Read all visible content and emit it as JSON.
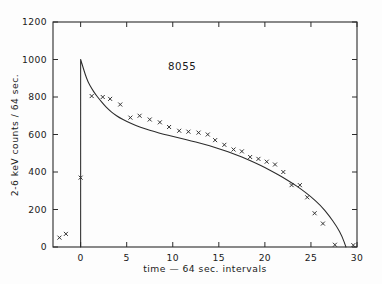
{
  "chart_data": {
    "type": "scatter",
    "title": "",
    "annotation": "8055",
    "xlabel": "time — 64 sec. intervals",
    "ylabel": "2-6 keV counts / 64 sec.",
    "xlim": [
      -3,
      30
    ],
    "ylim": [
      0,
      1200
    ],
    "xticks": [
      0,
      5,
      10,
      15,
      20,
      25,
      30
    ],
    "xtick_labels": [
      "0",
      "5",
      "10",
      "15",
      "20",
      "25",
      "30"
    ],
    "yticks": [
      0,
      200,
      400,
      600,
      800,
      1000,
      1200
    ],
    "ytick_labels": [
      "0",
      "200",
      "400",
      "600",
      "800",
      "1000",
      "1200"
    ],
    "grid": false,
    "legend": null,
    "marker": "x",
    "series": [
      {
        "name": "2-6 keV counts",
        "marker": "x",
        "color": "#2b2b2b",
        "x": [
          -2.3,
          -1.6,
          0.0,
          1.2,
          2.4,
          3.2,
          4.3,
          5.4,
          6.4,
          7.5,
          8.6,
          9.6,
          10.7,
          11.7,
          12.8,
          13.8,
          14.6,
          15.6,
          16.6,
          17.5,
          18.4,
          19.3,
          20.2,
          21.1,
          22.0,
          22.9,
          23.8,
          24.6,
          25.4,
          26.3,
          27.6,
          29.6
        ],
        "y": [
          50,
          70,
          370,
          805,
          800,
          790,
          760,
          690,
          700,
          680,
          665,
          640,
          620,
          615,
          610,
          600,
          570,
          545,
          520,
          510,
          480,
          470,
          455,
          440,
          400,
          330,
          330,
          265,
          180,
          125,
          12,
          10
        ]
      }
    ],
    "model": {
      "name": "fitted decay curve",
      "color": "#2b2b2b",
      "x": [
        0.0,
        0.25,
        0.5,
        0.8,
        1.2,
        1.6,
        2.0,
        2.5,
        3.0,
        3.6,
        4.2,
        5.0,
        6.0,
        7.0,
        8.0,
        9.0,
        10.0,
        11.0,
        12.0,
        13.0,
        14.0,
        15.0,
        16.0,
        17.0,
        18.0,
        19.0,
        20.0,
        21.0,
        22.0,
        23.0,
        24.0,
        25.0,
        26.0,
        27.0,
        27.8,
        28.4,
        28.8
      ],
      "y": [
        1000,
        960,
        920,
        880,
        845,
        815,
        790,
        760,
        735,
        710,
        690,
        670,
        648,
        630,
        615,
        602,
        590,
        578,
        566,
        553,
        540,
        525,
        508,
        490,
        470,
        448,
        424,
        398,
        370,
        340,
        306,
        268,
        225,
        165,
        110,
        55,
        0
      ]
    }
  },
  "axis_geometry": {
    "plot_left_px": 53,
    "plot_right_px": 357,
    "plot_top_px": 22,
    "plot_bottom_px": 247
  }
}
